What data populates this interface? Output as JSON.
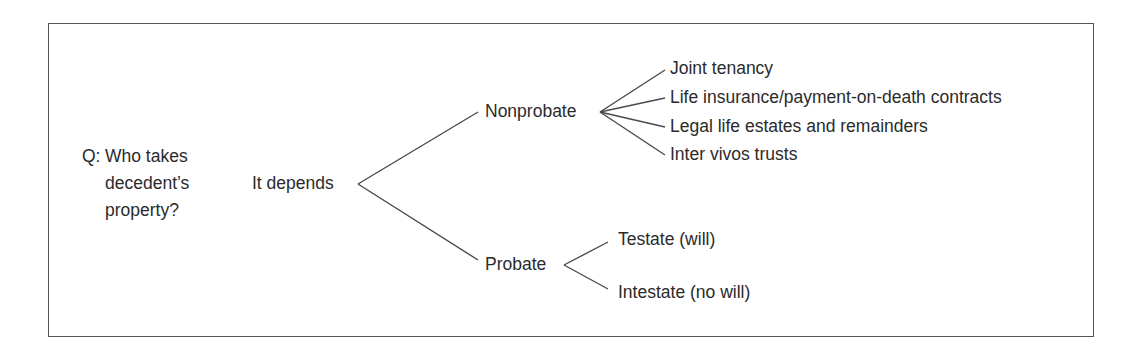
{
  "question": {
    "prefix": "Q:",
    "lines": [
      "Who takes",
      "decedent’s",
      "property?"
    ]
  },
  "root": {
    "label": "It depends"
  },
  "branches": [
    {
      "label": "Nonprobate",
      "children": [
        "Joint tenancy",
        "Life insurance/payment-on-death contracts",
        "Legal life estates and remainders",
        "Inter vivos trusts"
      ]
    },
    {
      "label": "Probate",
      "children": [
        "Testate (will)",
        "Intestate (no will)"
      ]
    }
  ],
  "colors": {
    "text": "#2b2b2b",
    "lines": "#4a4a4a",
    "border": "#555555"
  }
}
